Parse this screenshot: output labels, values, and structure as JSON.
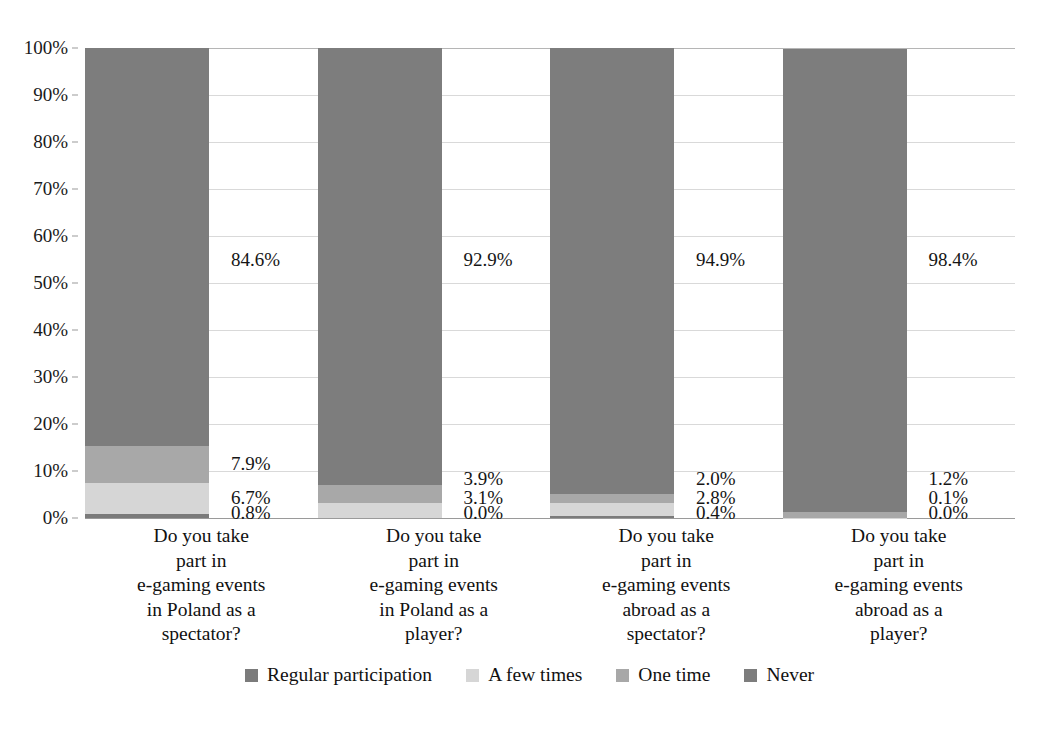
{
  "chart_data": {
    "type": "bar",
    "subtype": "100% stacked column",
    "title": "",
    "subtitle": "",
    "xlabel": "",
    "ylabel": "",
    "ylim": [
      0,
      100
    ],
    "grid": true,
    "legend_position": "bottom-center",
    "y_ticks": [
      "0%",
      "10%",
      "20%",
      "30%",
      "40%",
      "50%",
      "60%",
      "70%",
      "80%",
      "90%",
      "100%"
    ],
    "y_tick_values": [
      0,
      10,
      20,
      30,
      40,
      50,
      60,
      70,
      80,
      90,
      100
    ],
    "categories": [
      "Do you take part in e-gaming events in Poland as a spectator?",
      "Do you take part in e-gaming events in Poland as a player?",
      "Do you take part in e-gaming events abroad as a spectator?",
      "Do you take part in e-gaming events abroad as a player?"
    ],
    "category_lines": [
      [
        "Do you take",
        "part in",
        "e-gaming events",
        "in Poland as a",
        "spectator?"
      ],
      [
        "Do you take",
        "part in",
        "e-gaming events",
        "in Poland as a",
        "player?"
      ],
      [
        "Do you take",
        "part in",
        "e-gaming events",
        "abroad as a",
        "spectator?"
      ],
      [
        "Do you take",
        "part in",
        "e-gaming events",
        "abroad as a",
        "player?"
      ]
    ],
    "series": [
      {
        "name": "Regular participation",
        "color": "#7b7b7b",
        "values": [
          0.8,
          0.0,
          0.4,
          0.0
        ],
        "labels": [
          "0.8%",
          "0.0%",
          "0.4%",
          "0.0%"
        ]
      },
      {
        "name": "A few times",
        "color": "#d6d6d6",
        "values": [
          6.7,
          3.1,
          2.8,
          0.1
        ],
        "labels": [
          "6.7%",
          "3.1%",
          "2.8%",
          "0.1%"
        ]
      },
      {
        "name": "One time",
        "color": "#a8a8a8",
        "values": [
          7.9,
          3.9,
          2.0,
          1.2
        ],
        "labels": [
          "7.9%",
          "3.9%",
          "2.0%",
          "1.2%"
        ]
      },
      {
        "name": "Never",
        "color": "#7d7d7d",
        "values": [
          84.6,
          92.9,
          94.9,
          98.4
        ],
        "labels": [
          "84.6%",
          "92.9%",
          "94.9%",
          "98.4%"
        ]
      }
    ]
  },
  "legend": {
    "items": [
      {
        "label": "Regular participation",
        "color": "#7b7b7b"
      },
      {
        "label": "A few times",
        "color": "#d6d6d6"
      },
      {
        "label": "One time",
        "color": "#a8a8a8"
      },
      {
        "label": "Never",
        "color": "#7d7d7d"
      }
    ]
  }
}
